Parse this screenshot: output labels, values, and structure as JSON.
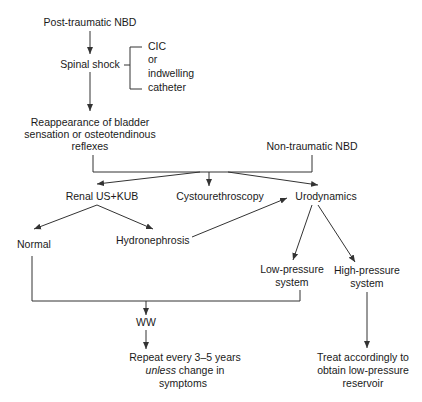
{
  "diagram": {
    "type": "flowchart",
    "colors": {
      "line": "#333333",
      "text": "#1a1a1a",
      "background": "#ffffff"
    },
    "nodes": {
      "post_traumatic": "Post-traumatic NBD",
      "spinal_shock": "Spinal shock",
      "cic": {
        "lines": [
          "CIC",
          "or",
          "indwelling",
          "catheter"
        ]
      },
      "reappearance": {
        "lines": [
          "Reappearance of bladder",
          "sensation or osteotendinous",
          "reflexes"
        ]
      },
      "non_traumatic": "Non-traumatic NBD",
      "renal_us": "Renal US+KUB",
      "cystourethroscopy": "Cystourethroscopy",
      "urodynamics": "Urodynamics",
      "normal": "Normal",
      "hydronephrosis": "Hydronephrosis",
      "low_pressure": {
        "lines": [
          "Low-pressure",
          "system"
        ]
      },
      "high_pressure": {
        "lines": [
          "High-pressure",
          "system"
        ]
      },
      "ww": "WW",
      "repeat": {
        "line1": "Repeat every 3–5 years",
        "line2_italic": "unless",
        "line2_rest": " change in",
        "line3": "symptoms"
      },
      "treat": {
        "lines": [
          "Treat accordingly  to",
          "obtain low-pressure",
          "reservoir"
        ]
      }
    },
    "edges": [
      {
        "from": "Post-traumatic NBD",
        "to": "Spinal shock"
      },
      {
        "from": "Spinal shock",
        "to": "CIC or indwelling catheter",
        "style": "bracket"
      },
      {
        "from": "Spinal shock",
        "to": "Reappearance of bladder sensation or osteotendinous reflexes"
      },
      {
        "from": "Reappearance of bladder sensation or osteotendinous reflexes",
        "to": "Renal US+KUB"
      },
      {
        "from": "Reappearance of bladder sensation or osteotendinous reflexes",
        "to": "Cystourethroscopy"
      },
      {
        "from": "Reappearance of bladder sensation or osteotendinous reflexes",
        "to": "Urodynamics"
      },
      {
        "from": "Non-traumatic NBD",
        "to": "Renal US+KUB"
      },
      {
        "from": "Non-traumatic NBD",
        "to": "Cystourethroscopy"
      },
      {
        "from": "Non-traumatic NBD",
        "to": "Urodynamics"
      },
      {
        "from": "Renal US+KUB",
        "to": "Normal"
      },
      {
        "from": "Renal US+KUB",
        "to": "Hydronephrosis"
      },
      {
        "from": "Hydronephrosis",
        "to": "Urodynamics"
      },
      {
        "from": "Urodynamics",
        "to": "Low-pressure system"
      },
      {
        "from": "Urodynamics",
        "to": "High-pressure system"
      },
      {
        "from": "Normal",
        "to": "WW"
      },
      {
        "from": "Low-pressure system",
        "to": "WW"
      },
      {
        "from": "WW",
        "to": "Repeat every 3–5 years unless change in symptoms"
      },
      {
        "from": "High-pressure system",
        "to": "Treat accordingly to obtain low-pressure reservoir"
      }
    ]
  }
}
